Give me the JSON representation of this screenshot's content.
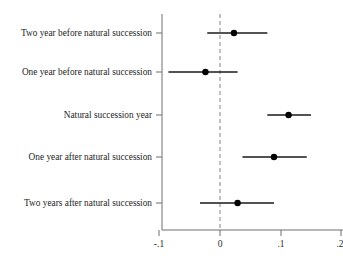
{
  "chart_data": {
    "type": "scatter",
    "subtype": "coefficient-forest-plot",
    "title": "",
    "subtitle": "",
    "xlabel": "",
    "ylabel": "",
    "xlim": [
      -0.12,
      0.21
    ],
    "xticks": [
      -0.1,
      0,
      0.1,
      0.2
    ],
    "xtick_labels": [
      "-.1",
      "0",
      ".1",
      ".2"
    ],
    "grid": false,
    "legend": null,
    "reference_line": {
      "x": 0,
      "style": "dashed",
      "color": "#9a9a9a"
    },
    "orientation": "horizontal",
    "categories": [
      "Two year before natural succession",
      "One year before natural succession",
      "Natural succession year",
      "One year after natural succession",
      "Two years after natural succession"
    ],
    "values": [
      0.023,
      -0.024,
      0.113,
      0.089,
      0.029
    ],
    "ci_low": [
      -0.021,
      -0.085,
      0.078,
      0.037,
      -0.033
    ],
    "ci_high": [
      0.078,
      0.029,
      0.15,
      0.143,
      0.089
    ],
    "series": [
      {
        "name": "Coefficient estimate",
        "points": [
          {
            "category": "Two year before natural succession",
            "value": 0.023,
            "ci_low": -0.021,
            "ci_high": 0.078
          },
          {
            "category": "One year before natural succession",
            "value": -0.024,
            "ci_low": -0.085,
            "ci_high": 0.029
          },
          {
            "category": "Natural succession year",
            "value": 0.113,
            "ci_low": 0.078,
            "ci_high": 0.15
          },
          {
            "category": "One year after natural succession",
            "value": 0.089,
            "ci_low": 0.037,
            "ci_high": 0.143
          },
          {
            "category": "Two years after natural succession",
            "value": 0.029,
            "ci_low": -0.033,
            "ci_high": 0.089
          }
        ]
      }
    ],
    "colors": {
      "marker": "#000000",
      "ci": "#1a1a1a",
      "axis": "#6f6f6f",
      "reference": "#9a9a9a",
      "background": "#ffffff",
      "text": "#1e1e1e"
    }
  }
}
